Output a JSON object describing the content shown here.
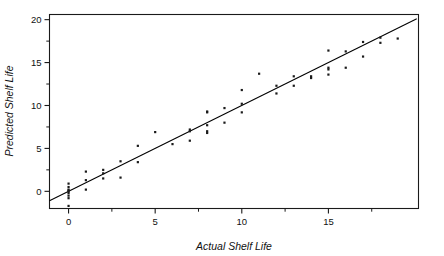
{
  "chart_data": {
    "type": "scatter",
    "title": "",
    "subtitle": "",
    "xlabel": "Actual Shelf Life",
    "ylabel": "Predicted Shelf Life",
    "xlim": [
      -1.1,
      20.2
    ],
    "ylim": [
      -2.0,
      20.6
    ],
    "xticks": [
      0,
      5,
      10,
      15
    ],
    "yticks": [
      0,
      5,
      10,
      15,
      20
    ],
    "xtick_labels": [
      "0",
      "5",
      "10",
      "15"
    ],
    "ytick_labels": [
      "0",
      "5",
      "10",
      "15",
      "20"
    ],
    "xminor_ticks": [
      2.5,
      7.5,
      12.5,
      17.5
    ],
    "yminor_ticks": [
      2.5,
      7.5,
      12.5,
      17.5
    ],
    "grid": false,
    "legend": null,
    "frame": true,
    "marker": "square",
    "marker_color": "#1a1a1a",
    "marker_size_px": 2.2,
    "reference_line": {
      "label": "identity line y = x",
      "x": [
        -1.1,
        20.1
      ],
      "y": [
        -1.1,
        20.1
      ],
      "color": "#000000",
      "width_px": 1.1
    },
    "x": [
      0,
      0,
      0,
      0,
      0,
      0,
      0,
      0,
      0,
      1,
      1,
      1,
      2,
      2,
      2,
      3,
      3,
      4,
      4,
      5,
      6,
      7,
      7,
      7,
      8,
      8,
      8,
      8,
      8,
      9,
      9,
      10,
      10,
      10,
      11,
      12,
      12,
      13,
      13,
      14,
      14,
      15,
      15,
      15,
      15,
      16,
      16,
      17,
      17,
      18,
      18,
      19
    ],
    "y": [
      0.9,
      0.5,
      0.2,
      0.1,
      0.0,
      -0.2,
      -0.5,
      -0.8,
      -1.7,
      2.3,
      1.3,
      0.2,
      2.5,
      2.1,
      1.5,
      3.5,
      1.6,
      5.3,
      3.4,
      6.9,
      5.5,
      7.2,
      7.0,
      5.9,
      9.3,
      9.2,
      7.7,
      7.0,
      6.8,
      9.7,
      8.0,
      10.2,
      11.8,
      9.2,
      13.7,
      12.3,
      11.4,
      13.4,
      12.3,
      13.4,
      13.2,
      16.4,
      14.4,
      14.2,
      13.6,
      16.3,
      14.4,
      17.4,
      15.7,
      17.9,
      17.3,
      17.8
    ]
  },
  "axes": {
    "x_title": "Actual Shelf Life",
    "y_title": "Predicted Shelf Life"
  }
}
